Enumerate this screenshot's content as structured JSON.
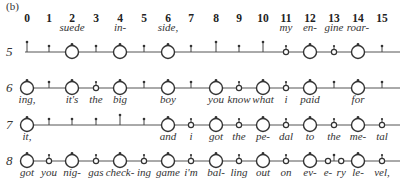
{
  "panel_label": "(b)",
  "columns": [
    "0",
    "1",
    "2",
    "3",
    "4",
    "5",
    "6",
    "7",
    "8",
    "9",
    "10",
    "11",
    "12",
    "13",
    "14",
    "15"
  ],
  "layout": {
    "col_x": [
      27,
      49,
      72,
      96,
      120,
      144,
      168,
      191,
      216,
      239,
      263,
      286,
      310,
      334,
      358,
      382
    ],
    "line_start": 25,
    "line_end": 400,
    "header_y": 22
  },
  "rows": [
    {
      "number": "5",
      "line_y": 52,
      "words_above": true,
      "beats": [
        {
          "col": 0,
          "mark": "tick-tall",
          "word": ""
        },
        {
          "col": 1,
          "mark": "tick",
          "word": ""
        },
        {
          "col": 2,
          "mark": "big",
          "word": "suede"
        },
        {
          "col": 3,
          "mark": "tick",
          "word": ""
        },
        {
          "col": 4,
          "mark": "big",
          "word": "in-"
        },
        {
          "col": 5,
          "mark": "tick",
          "word": ""
        },
        {
          "col": 6,
          "mark": "big",
          "word": "side,"
        },
        {
          "col": 7,
          "mark": "tick",
          "word": ""
        },
        {
          "col": 8,
          "mark": "tick-tall",
          "word": ""
        },
        {
          "col": 9,
          "mark": "tick",
          "word": ""
        },
        {
          "col": 10,
          "mark": "tick-tall",
          "word": ""
        },
        {
          "col": 11,
          "mark": "small",
          "word": "my"
        },
        {
          "col": 12,
          "mark": "big",
          "word": "en-"
        },
        {
          "col": 13,
          "mark": "small",
          "word": "gine"
        },
        {
          "col": 14,
          "mark": "big",
          "word": "roar-"
        },
        {
          "col": 15,
          "mark": "tick",
          "word": ""
        }
      ]
    },
    {
      "number": "6",
      "line_y": 88,
      "words_above": false,
      "beats": [
        {
          "col": 0,
          "mark": "big",
          "word": "ing,"
        },
        {
          "col": 1,
          "mark": "tick",
          "word": ""
        },
        {
          "col": 2,
          "mark": "big",
          "word": "it's"
        },
        {
          "col": 3,
          "mark": "small",
          "word": "the"
        },
        {
          "col": 4,
          "mark": "big",
          "word": "big"
        },
        {
          "col": 5,
          "mark": "tick",
          "word": ""
        },
        {
          "col": 6,
          "mark": "big",
          "word": "boy"
        },
        {
          "col": 7,
          "mark": "tick",
          "word": ""
        },
        {
          "col": 8,
          "mark": "big",
          "word": "you"
        },
        {
          "col": 9,
          "mark": "small",
          "word": "know"
        },
        {
          "col": 10,
          "mark": "big",
          "word": "what"
        },
        {
          "col": 11,
          "mark": "small",
          "word": "i"
        },
        {
          "col": 12,
          "mark": "big",
          "word": "paid"
        },
        {
          "col": 13,
          "mark": "tick",
          "word": ""
        },
        {
          "col": 14,
          "mark": "big",
          "word": "for"
        },
        {
          "col": 15,
          "mark": "tick",
          "word": ""
        }
      ]
    },
    {
      "number": "7",
      "line_y": 125,
      "words_above": false,
      "beats": [
        {
          "col": 0,
          "mark": "big",
          "word": "it,"
        },
        {
          "col": 1,
          "mark": "tick",
          "word": ""
        },
        {
          "col": 2,
          "mark": "tick",
          "word": ""
        },
        {
          "col": 3,
          "mark": "tick",
          "word": ""
        },
        {
          "col": 4,
          "mark": "tick-tall",
          "word": ""
        },
        {
          "col": 5,
          "mark": "tick",
          "word": ""
        },
        {
          "col": 6,
          "mark": "big",
          "word": "and"
        },
        {
          "col": 7,
          "mark": "small",
          "word": "i"
        },
        {
          "col": 8,
          "mark": "big",
          "word": "got"
        },
        {
          "col": 9,
          "mark": "small",
          "word": "the"
        },
        {
          "col": 10,
          "mark": "big",
          "word": "pe-"
        },
        {
          "col": 11,
          "mark": "small",
          "word": "dal"
        },
        {
          "col": 12,
          "mark": "big",
          "word": "to"
        },
        {
          "col": 13,
          "mark": "small",
          "word": "the"
        },
        {
          "col": 14,
          "mark": "big",
          "word": "me-"
        },
        {
          "col": 15,
          "mark": "small",
          "word": "tal"
        }
      ]
    },
    {
      "number": "8",
      "line_y": 161,
      "words_above": false,
      "beats": [
        {
          "col": 0,
          "mark": "big",
          "word": "got"
        },
        {
          "col": 1,
          "mark": "small",
          "word": "you"
        },
        {
          "col": 2,
          "mark": "big",
          "word": "nig-"
        },
        {
          "col": 3,
          "mark": "small",
          "word": "gas"
        },
        {
          "col": 4,
          "mark": "big",
          "word": "check-"
        },
        {
          "col": 5,
          "mark": "small",
          "word": "ing"
        },
        {
          "col": 6,
          "mark": "big",
          "word": "game"
        },
        {
          "col": 7,
          "mark": "small",
          "word": "i'm"
        },
        {
          "col": 8,
          "mark": "big",
          "word": "bal-"
        },
        {
          "col": 9,
          "mark": "small",
          "word": "ling"
        },
        {
          "col": 10,
          "mark": "big",
          "word": "out"
        },
        {
          "col": 11,
          "mark": "small",
          "word": "on"
        },
        {
          "col": 12,
          "mark": "big",
          "word": "ev-"
        },
        {
          "col": 12.75,
          "mark": "small-plain",
          "word": "e-"
        },
        {
          "col": 13,
          "mark": "tick",
          "word": ""
        },
        {
          "col": 13.3,
          "mark": "small-plain",
          "word": "ry"
        },
        {
          "col": 14,
          "mark": "big",
          "word": "le-"
        },
        {
          "col": 15,
          "mark": "small",
          "word": "vel,"
        }
      ]
    }
  ]
}
